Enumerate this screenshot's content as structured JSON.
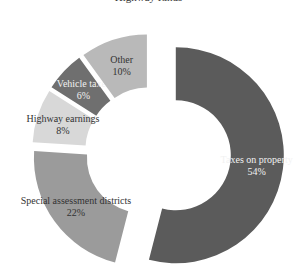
{
  "chart_data": {
    "type": "pie",
    "style": "donut, exploded slices",
    "title": "Highway funds",
    "categories": [
      "Taxes on property",
      "Special assessment districts",
      "Highway earnings",
      "Vehicle taxes",
      "Other"
    ],
    "values": [
      54,
      22,
      8,
      6,
      10
    ],
    "labels": [
      {
        "name": "Taxes on property",
        "pct": "54%"
      },
      {
        "name": "Special assessment districts",
        "pct": "22%"
      },
      {
        "name": "Highway earnings",
        "pct": "8%"
      },
      {
        "name": "Vehicle taxes",
        "pct": "6%"
      },
      {
        "name": "Other",
        "pct": "10%"
      }
    ],
    "colors": [
      "#5b5b5b",
      "#9b9b9b",
      "#d8d8d8",
      "#6f6f6f",
      "#b9b9b9"
    ],
    "start_angle_deg": 0,
    "direction": "clockwise"
  }
}
